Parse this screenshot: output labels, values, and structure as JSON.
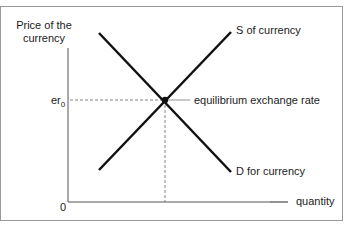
{
  "diagram": {
    "y_axis_label_line1": "Price of the",
    "y_axis_label_line2": "currency",
    "x_axis_label": "quantity",
    "origin_label": "0",
    "er_label": "er",
    "er_subscript": "0",
    "supply_label": "S of currency",
    "demand_label": "D for currency",
    "equilibrium_label": "equilibrium exchange rate"
  }
}
